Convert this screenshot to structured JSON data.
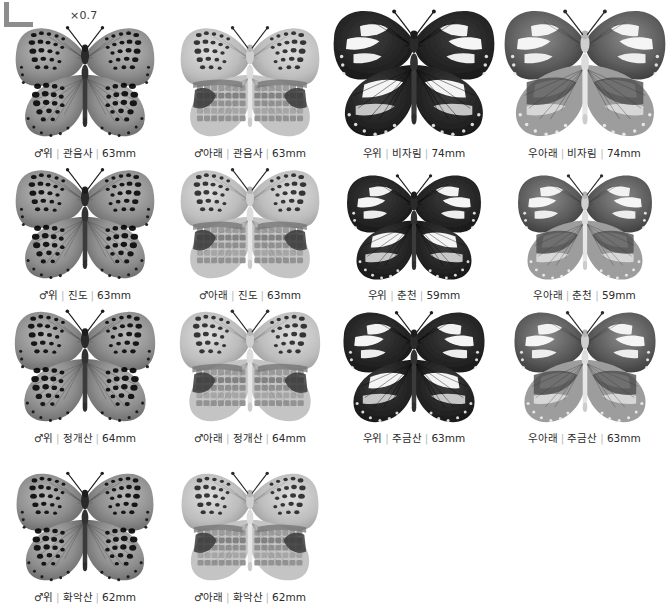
{
  "plate": {
    "scale_label": "×0.7",
    "corner_mark": "registration-corner-mark",
    "columns": 4,
    "rows": 4,
    "caption_separator": "|",
    "colors": {
      "background": "#ffffff",
      "caption_text": "#2b2b2b",
      "separator": "#b9b9b9",
      "corner_mark": "#8d8d8d"
    },
    "specimens": [
      {
        "sex": "♂",
        "view": "위",
        "locality": "관음사",
        "size": "63mm",
        "pattern": "fritillary-upperside",
        "caption": "♂위 | 관음사 | 63mm"
      },
      {
        "sex": "♂",
        "view": "아래",
        "locality": "관음사",
        "size": "63mm",
        "pattern": "fritillary-underside",
        "caption": "♂아래 | 관음사 | 63mm"
      },
      {
        "sex": "우",
        "view": "위",
        "locality": "비자림",
        "size": "74mm",
        "pattern": "dark-female-upperside",
        "caption": "우 위 | 비자림 | 74mm"
      },
      {
        "sex": "우",
        "view": "아래",
        "locality": "비자림",
        "size": "74mm",
        "pattern": "dark-female-underside",
        "caption": "우 아래 | 비자림 | 74mm"
      },
      {
        "sex": "♂",
        "view": "위",
        "locality": "진도",
        "size": "63mm",
        "pattern": "fritillary-upperside",
        "caption": "♂위 | 진도 | 63mm"
      },
      {
        "sex": "♂",
        "view": "아래",
        "locality": "진도",
        "size": "63mm",
        "pattern": "fritillary-underside",
        "caption": "♂아래 | 진도 | 63mm"
      },
      {
        "sex": "우",
        "view": "위",
        "locality": "춘천",
        "size": "59mm",
        "pattern": "dark-female-upperside",
        "caption": "우 위 | 춘천 | 59mm"
      },
      {
        "sex": "우",
        "view": "아래",
        "locality": "춘천",
        "size": "59mm",
        "pattern": "dark-female-underside",
        "caption": "우 아래 | 춘천 | 59mm"
      },
      {
        "sex": "♂",
        "view": "위",
        "locality": "정개산",
        "size": "64mm",
        "pattern": "fritillary-upperside",
        "caption": "♂위 | 정개산 | 64mm"
      },
      {
        "sex": "♂",
        "view": "아래",
        "locality": "정개산",
        "size": "64mm",
        "pattern": "fritillary-underside",
        "caption": "♂아래 | 정개산 | 64mm"
      },
      {
        "sex": "우",
        "view": "위",
        "locality": "주금산",
        "size": "63mm",
        "pattern": "dark-female-upperside",
        "caption": "우 위 | 주금산 | 63mm"
      },
      {
        "sex": "우",
        "view": "아래",
        "locality": "주금산",
        "size": "63mm",
        "pattern": "dark-female-underside",
        "caption": "우 아래 | 주금산 | 63mm"
      },
      {
        "sex": "♂",
        "view": "위",
        "locality": "화악산",
        "size": "62mm",
        "pattern": "fritillary-upperside",
        "caption": "♂위 | 화악산 | 62mm"
      },
      {
        "sex": "♂",
        "view": "아래",
        "locality": "화악산",
        "size": "62mm",
        "pattern": "fritillary-underside",
        "caption": "♂아래 | 화악산 | 62mm"
      }
    ]
  }
}
